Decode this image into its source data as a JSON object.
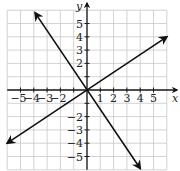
{
  "chart_data": {
    "type": "line",
    "title": "",
    "xlabel": "x",
    "ylabel": "y",
    "xlim": [
      -6,
      6
    ],
    "ylim": [
      -6,
      6
    ],
    "grid": true,
    "x_ticks": [
      -5,
      -4,
      -3,
      -2,
      1,
      2,
      3,
      4,
      5
    ],
    "y_ticks": [
      5,
      4,
      3,
      2,
      -2,
      -3,
      -4,
      -5
    ],
    "x_tick_labels": [
      "−5",
      "−4",
      "−3",
      "−2",
      "1",
      "2",
      "3",
      "4",
      "5"
    ],
    "y_tick_labels": [
      "5",
      "4",
      "3",
      "2",
      "−2",
      "−3",
      "−4",
      "−5"
    ],
    "series": [
      {
        "name": "line-negative-slope",
        "equation": "y = -3/2 x",
        "points": [
          [
            -4,
            6
          ],
          [
            0,
            0
          ],
          [
            4,
            -6
          ]
        ],
        "arrows": "both"
      },
      {
        "name": "line-positive-slope",
        "equation": "y = 2/3 x",
        "points": [
          [
            -6,
            -4
          ],
          [
            0,
            0
          ],
          [
            6,
            4
          ]
        ],
        "arrows": "both"
      }
    ]
  },
  "colors": {
    "grid": "#c8c8c8",
    "axis": "#1a1a1a",
    "line": "#111111"
  }
}
